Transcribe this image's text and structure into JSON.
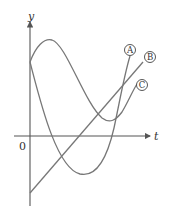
{
  "figure": {
    "axes": {
      "x_label": "t",
      "y_label": "y",
      "origin_label": "0"
    },
    "curves": [
      {
        "id": "A",
        "label": "A",
        "description": "curve starting at y-intercept, dipping to deep minimum, rising steeply"
      },
      {
        "id": "B",
        "label": "B",
        "description": "straight line with positive slope, negative y-intercept"
      },
      {
        "id": "C",
        "label": "C",
        "description": "curve starting at y-intercept, rising to maximum, falling to minimum above axis, rising"
      }
    ],
    "colors": {
      "curve": "#777777",
      "axis": "#555555"
    }
  }
}
